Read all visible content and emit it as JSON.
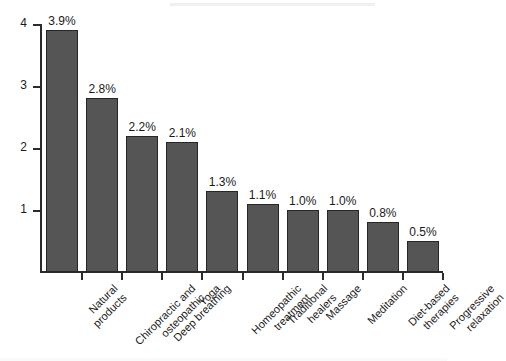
{
  "chart_data": {
    "type": "bar",
    "title": "",
    "subtitle": "",
    "xlabel": "",
    "ylabel": "",
    "ylim": [
      0,
      4.3
    ],
    "y_ticks": [
      "1",
      "2",
      "3",
      "4"
    ],
    "y_tick_values": [
      1,
      2,
      3,
      4
    ],
    "grid": false,
    "legend": "none",
    "orientation": "vertical",
    "bar_color": "#555555",
    "bar_edge_color": "#262626",
    "background_color": "#ffffff",
    "axis_color": "#2b2b2b",
    "label_rotation_deg": -45,
    "categories": [
      "Natural\nproducts",
      "Chiropractic and\nosteopathic",
      "Deep breathing",
      "Yoga",
      "Homeopathic\ntreatment",
      "Traditional\nhealers",
      "Massage",
      "Meditation",
      "Diet-based\ntherapies",
      "Progressive\nrelaxation"
    ],
    "values": [
      3.9,
      2.8,
      2.2,
      2.1,
      1.3,
      1.1,
      1.0,
      1.0,
      0.8,
      0.5
    ],
    "value_labels": [
      "3.9%",
      "2.8%",
      "2.2%",
      "2.1%",
      "1.3%",
      "1.1%",
      "1.0%",
      "1.0%",
      "0.8%",
      "0.5%"
    ],
    "units": "percent"
  }
}
